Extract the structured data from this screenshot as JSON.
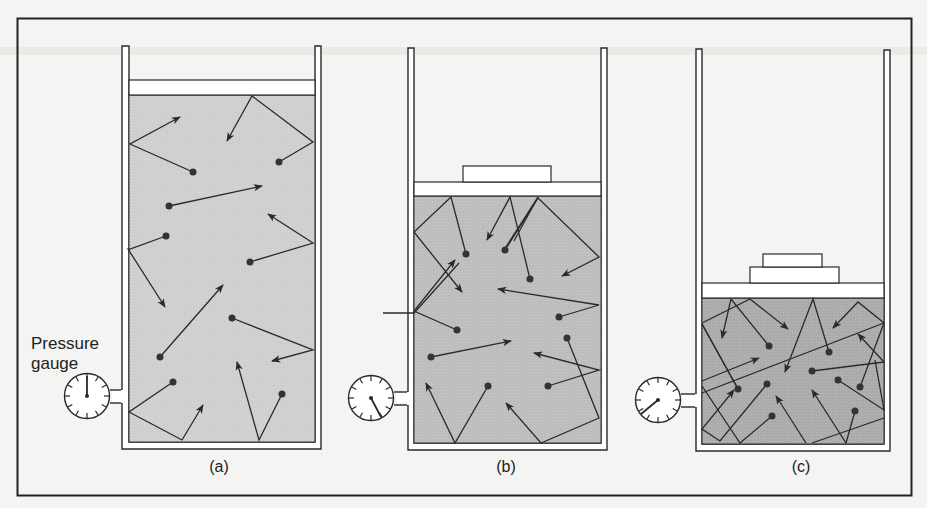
{
  "figure": {
    "colors": {
      "background": "#f4f4f2",
      "frame": "#222222",
      "gas_light": "#cfcfcf",
      "gas_medium": "#bdbdbd",
      "gas_dark": "#ababab",
      "line": "#2a2a2a",
      "molecule": "#333333"
    },
    "gauge_label_line1": "Pressure",
    "gauge_label_line2": "gauge",
    "panels": [
      {
        "id": "a",
        "caption": "(a)",
        "weights": 0,
        "gauge_reading": "low",
        "gas_volume": "large"
      },
      {
        "id": "b",
        "caption": "(b)",
        "weights": 1,
        "gauge_reading": "medium",
        "gas_volume": "medium"
      },
      {
        "id": "c",
        "caption": "(c)",
        "weights": 2,
        "gauge_reading": "high",
        "gas_volume": "small"
      }
    ]
  }
}
